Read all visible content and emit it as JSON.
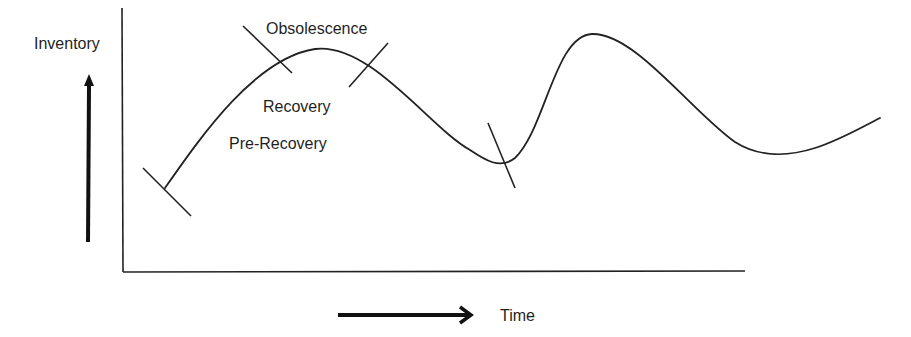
{
  "diagram": {
    "type": "inventory-lifecycle-curve",
    "axes": {
      "y_label": "Inventory",
      "x_label": "Time"
    },
    "phase_labels": [
      {
        "id": "obsolescence",
        "text": "Obsolescence"
      },
      {
        "id": "recovery",
        "text": "Recovery"
      },
      {
        "id": "pre-recovery",
        "text": "Pre-Recovery"
      }
    ],
    "curve": {
      "description": "Wave-like inventory curve: rises to a peak, falls to a trough, rises to a higher peak, falls, then rises gently",
      "stroke_color": "#222222"
    },
    "phase_markers": 4
  }
}
